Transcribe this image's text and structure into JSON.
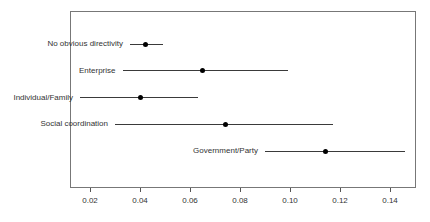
{
  "chart_data": {
    "type": "scatter",
    "subtype": "dot-with-error-bars",
    "orientation": "horizontal",
    "title": "",
    "xlabel": "",
    "ylabel": "",
    "categories": [
      "No obvious directivity",
      "Enterprise",
      "Individual/Family",
      "Social coordination",
      "Government/Party"
    ],
    "series": [
      {
        "name": "estimate",
        "values": [
          0.042,
          0.065,
          0.04,
          0.074,
          0.114
        ]
      },
      {
        "name": "ci_low",
        "values": [
          0.036,
          0.033,
          0.016,
          0.03,
          0.09
        ]
      },
      {
        "name": "ci_high",
        "values": [
          0.049,
          0.099,
          0.063,
          0.117,
          0.146
        ]
      }
    ],
    "x_ticks": [
      0.02,
      0.04,
      0.06,
      0.08,
      0.1,
      0.12,
      0.14
    ],
    "x_tick_labels": [
      "0.02",
      "0.04",
      "0.06",
      "0.08",
      "0.10",
      "0.12",
      "0.14"
    ],
    "xlim": [
      0.012,
      0.15
    ],
    "grid": false,
    "legend_position": "none",
    "colors": {
      "interval_line": "#3a3a3a",
      "point": "#000000",
      "box_border": "#777777",
      "tick": "#555555",
      "text": "#333333",
      "background": "#ffffff"
    }
  }
}
